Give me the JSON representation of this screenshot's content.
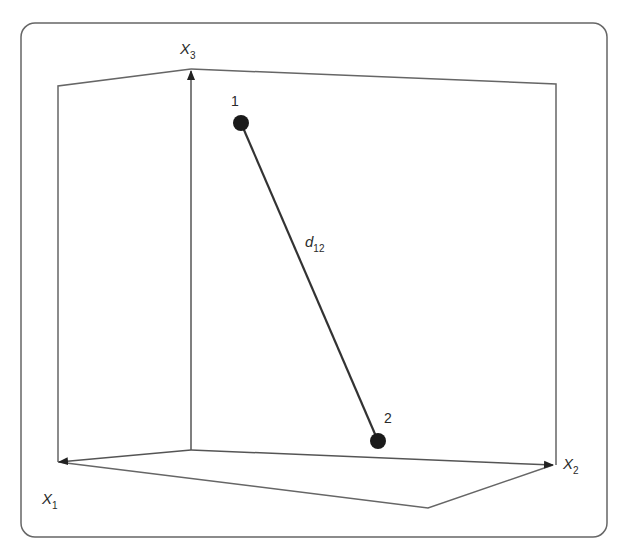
{
  "diagram": {
    "type": "3d-coordinate-space",
    "axes": [
      {
        "name": "x1",
        "base": "X",
        "sub": "1"
      },
      {
        "name": "x2",
        "base": "X",
        "sub": "2"
      },
      {
        "name": "x3",
        "base": "X",
        "sub": "3"
      }
    ],
    "points": [
      {
        "label": "1"
      },
      {
        "label": "2"
      }
    ],
    "distance_label": {
      "base": "d",
      "sub": "12"
    },
    "colors": {
      "line": "#555555",
      "point": "#1a1a1a",
      "text": "#2a2a2a"
    }
  }
}
